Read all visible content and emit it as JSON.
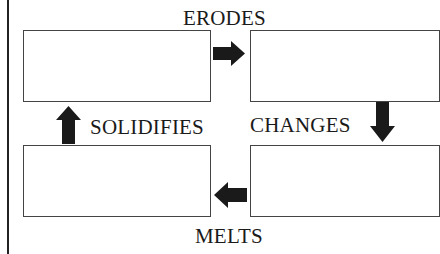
{
  "diagram": {
    "type": "cycle",
    "labels": {
      "top": "ERODES",
      "right": "CHANGES",
      "bottom": "MELTS",
      "left": "SOLIDIFIES"
    },
    "boxes": [
      {
        "position": "top-left",
        "text": ""
      },
      {
        "position": "top-right",
        "text": ""
      },
      {
        "position": "bottom-right",
        "text": ""
      },
      {
        "position": "bottom-left",
        "text": ""
      }
    ],
    "arrows": [
      {
        "from": "top-left",
        "to": "top-right",
        "direction": "right"
      },
      {
        "from": "top-right",
        "to": "bottom-right",
        "direction": "down"
      },
      {
        "from": "bottom-right",
        "to": "bottom-left",
        "direction": "left"
      },
      {
        "from": "bottom-left",
        "to": "top-left",
        "direction": "up"
      }
    ],
    "colors": {
      "line": "#222222",
      "arrow": "#1a1a1a",
      "box_border": "#444444"
    }
  }
}
